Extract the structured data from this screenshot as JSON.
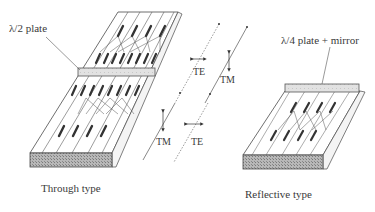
{
  "diagram": {
    "through_type": {
      "caption": "Through type",
      "plate_label": "λ/2 plate"
    },
    "reflective_type": {
      "caption": "Reflective type",
      "plate_label": "λ/4 plate + mirror"
    },
    "polarization_labels": {
      "upper_te": "TE",
      "upper_tm": "TM",
      "lower_tm": "TM",
      "lower_te": "TE"
    },
    "colors": {
      "line": "#4a4a4a",
      "waveguide_segment": "#3a3a3a",
      "plate_fill": "#e4e4e4",
      "face_hatch": "#9a9a9a",
      "background": "#ffffff"
    }
  }
}
